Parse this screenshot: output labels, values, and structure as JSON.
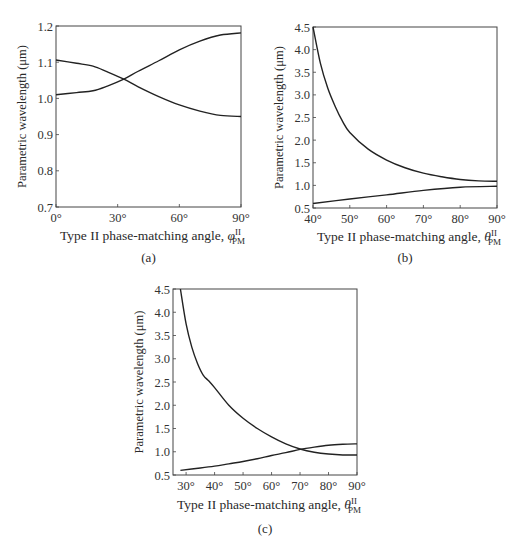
{
  "chart_data": [
    {
      "type": "line",
      "panel": "(a)",
      "title": "",
      "xlabel": "Type II phase-matching angle, φ_PM^II",
      "xlabel_main": "Type II phase-matching angle, ",
      "xlabel_symbol": "φ",
      "xlabel_sup": "II",
      "xlabel_sub": "PM",
      "ylabel": "Parametric wavelength (μm)",
      "caption": "(a)",
      "xlim": [
        0,
        90
      ],
      "ylim": [
        0.7,
        1.2
      ],
      "xticks": [
        0,
        30,
        60,
        90
      ],
      "xtick_labels": [
        "0°",
        "30°",
        "60°",
        "90°"
      ],
      "yticks": [
        0.7,
        0.8,
        0.9,
        1.0,
        1.1,
        1.2
      ],
      "ytick_labels": [
        "0.7",
        "0.8",
        "0.9",
        "1.0",
        "1.1",
        "1.2"
      ],
      "grid": false,
      "series": [
        {
          "name": "signal (descending)",
          "x": [
            0,
            10,
            18,
            25,
            33,
            40,
            50,
            60,
            70,
            80,
            90
          ],
          "values": [
            1.106,
            1.097,
            1.089,
            1.073,
            1.053,
            1.032,
            1.005,
            0.982,
            0.965,
            0.953,
            0.95
          ]
        },
        {
          "name": "idler (ascending)",
          "x": [
            0,
            10,
            18,
            25,
            33,
            40,
            50,
            60,
            70,
            80,
            90
          ],
          "values": [
            1.01,
            1.016,
            1.021,
            1.034,
            1.053,
            1.075,
            1.104,
            1.134,
            1.158,
            1.175,
            1.181
          ]
        }
      ]
    },
    {
      "type": "line",
      "panel": "(b)",
      "title": "",
      "xlabel": "Type II phase-matching angle, θ_PM^II",
      "xlabel_main": "Type II phase-matching angle, ",
      "xlabel_symbol": "θ",
      "xlabel_sup": "II",
      "xlabel_sub": "PM",
      "ylabel": "Parametric wavelength (μm)",
      "caption": "(b)",
      "xlim": [
        40,
        90
      ],
      "ylim": [
        0.5,
        4.5
      ],
      "xticks": [
        40,
        50,
        60,
        70,
        80,
        90
      ],
      "xtick_labels": [
        "40°",
        "50°",
        "60°",
        "70°",
        "80°",
        "90°"
      ],
      "yticks": [
        0.5,
        1.0,
        1.5,
        2.0,
        2.5,
        3.0,
        3.5,
        4.0,
        4.5
      ],
      "ytick_labels": [
        "0.5",
        "1.0",
        "1.5",
        "2.0",
        "2.5",
        "3.0",
        "3.5",
        "4.0",
        "4.5"
      ],
      "grid": false,
      "series": [
        {
          "name": "idler (upper)",
          "x": [
            40,
            42,
            44,
            46,
            48,
            50,
            55,
            60,
            65,
            70,
            75,
            80,
            85,
            90
          ],
          "values": [
            4.5,
            3.7,
            3.15,
            2.75,
            2.42,
            2.17,
            1.8,
            1.56,
            1.39,
            1.27,
            1.19,
            1.13,
            1.1,
            1.09
          ]
        },
        {
          "name": "signal (lower)",
          "x": [
            40,
            50,
            60,
            70,
            80,
            90
          ],
          "values": [
            0.6,
            0.7,
            0.79,
            0.89,
            0.96,
            0.98
          ]
        }
      ]
    },
    {
      "type": "line",
      "panel": "(c)",
      "title": "",
      "xlabel": "Type II phase-matching angle, θ_PM^II",
      "xlabel_main": "Type II phase-matching angle, ",
      "xlabel_symbol": "θ",
      "xlabel_sup": "II",
      "xlabel_sub": "PM",
      "ylabel": "Parametric wavelength (μm)",
      "caption": "(c)",
      "xlim": [
        25.4,
        90
      ],
      "ylim": [
        0.5,
        4.5
      ],
      "xticks": [
        30,
        40,
        50,
        60,
        70,
        80,
        90
      ],
      "xtick_labels": [
        "30°",
        "40°",
        "50°",
        "60°",
        "70°",
        "80°",
        "90°"
      ],
      "yticks": [
        0.5,
        1.0,
        1.5,
        2.0,
        2.5,
        3.0,
        3.5,
        4.0,
        4.5
      ],
      "ytick_labels": [
        "0.5",
        "1.0",
        "1.5",
        "2.0",
        "2.5",
        "3.0",
        "3.5",
        "4.0",
        "4.5"
      ],
      "grid": false,
      "series": [
        {
          "name": "idler (upper)",
          "x": [
            28,
            30,
            32,
            34,
            36,
            38,
            40,
            45,
            50,
            55,
            60,
            65,
            70,
            75,
            80,
            85,
            90
          ],
          "values": [
            4.5,
            3.75,
            3.25,
            2.9,
            2.65,
            2.52,
            2.38,
            2.0,
            1.72,
            1.5,
            1.32,
            1.17,
            1.06,
            0.99,
            0.95,
            0.93,
            0.93
          ]
        },
        {
          "name": "signal (lower)",
          "x": [
            28,
            35,
            40,
            45,
            50,
            55,
            60,
            65,
            70,
            75,
            80,
            85,
            90
          ],
          "values": [
            0.6,
            0.65,
            0.69,
            0.74,
            0.79,
            0.85,
            0.92,
            0.98,
            1.05,
            1.1,
            1.14,
            1.16,
            1.17
          ]
        }
      ]
    }
  ],
  "layout": {
    "panels": [
      {
        "left": 56,
        "top": 26,
        "right": 241,
        "bottom": 207,
        "xlabel_y": 240,
        "caption_y": 262
      },
      {
        "left": 313,
        "top": 27,
        "right": 497,
        "bottom": 208,
        "xlabel_y": 241,
        "caption_y": 262
      },
      {
        "left": 173,
        "top": 289,
        "right": 357,
        "bottom": 475,
        "xlabel_y": 509,
        "caption_y": 533
      }
    ]
  }
}
